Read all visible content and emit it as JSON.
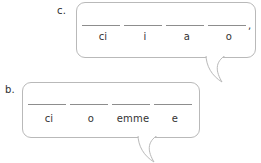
{
  "page": {
    "type": "worksheet-exercise",
    "background_color": "#ffffff",
    "bubble_border_color": "#b9b9b9",
    "blank_line_color": "#8d8d8d",
    "text_color": "#333333"
  },
  "exercises": [
    {
      "id": "c",
      "label": "c.",
      "blanks": [
        {
          "width": 38
        },
        {
          "width": 38
        },
        {
          "width": 38
        },
        {
          "width": 38
        }
      ],
      "trailing_punctuation": ",",
      "hints": [
        {
          "text": "ci",
          "width": 42
        },
        {
          "text": "i",
          "width": 42
        },
        {
          "text": "a",
          "width": 42
        },
        {
          "text": "o",
          "width": 42
        }
      ]
    },
    {
      "id": "b",
      "label": "b.",
      "blanks": [
        {
          "width": 38
        },
        {
          "width": 38
        },
        {
          "width": 38
        },
        {
          "width": 38
        }
      ],
      "trailing_punctuation": "",
      "hints": [
        {
          "text": "ci",
          "width": 42
        },
        {
          "text": "o",
          "width": 42
        },
        {
          "text": "emme",
          "width": 42
        },
        {
          "text": "e",
          "width": 42
        }
      ]
    }
  ]
}
